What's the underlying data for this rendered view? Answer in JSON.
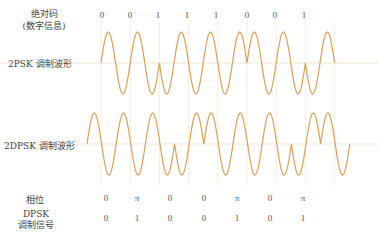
{
  "labels": {
    "absolute_code_line1": "绝对码",
    "absolute_code_line2": "(数字信息)",
    "psk_wave": "2PSK 调制波形",
    "dpsk_wave": "2DPSK 调制波形",
    "phase": "相位",
    "dpsk_signal_line1": "DPSK",
    "dpsk_signal_line2": "调制信号"
  },
  "absolute_bits": [
    "0",
    "0",
    "1",
    "1",
    "1",
    "0",
    "0",
    "1"
  ],
  "phase_row": [
    "0",
    "π",
    "0",
    "0",
    "π",
    "0",
    "π"
  ],
  "dpsk_signal_row": [
    "0",
    "1",
    "0",
    "0",
    "1",
    "0",
    "1"
  ],
  "colors": {
    "waveform": "#d4a35a",
    "gridline": "#f3ead8",
    "baseline": "#f1e6d0"
  },
  "waveforms": {
    "psk": {
      "start_x": 101,
      "period": 29.2,
      "baseline_y": 63,
      "amplitude": 31,
      "phases": [
        0,
        0,
        1,
        1,
        1,
        0,
        0,
        1
      ]
    },
    "dpsk": {
      "start_x": 87,
      "period": 29.2,
      "baseline_y": 144,
      "amplitude": 31,
      "phases": [
        0,
        0,
        0,
        1,
        0,
        0,
        0,
        1,
        0
      ]
    }
  }
}
